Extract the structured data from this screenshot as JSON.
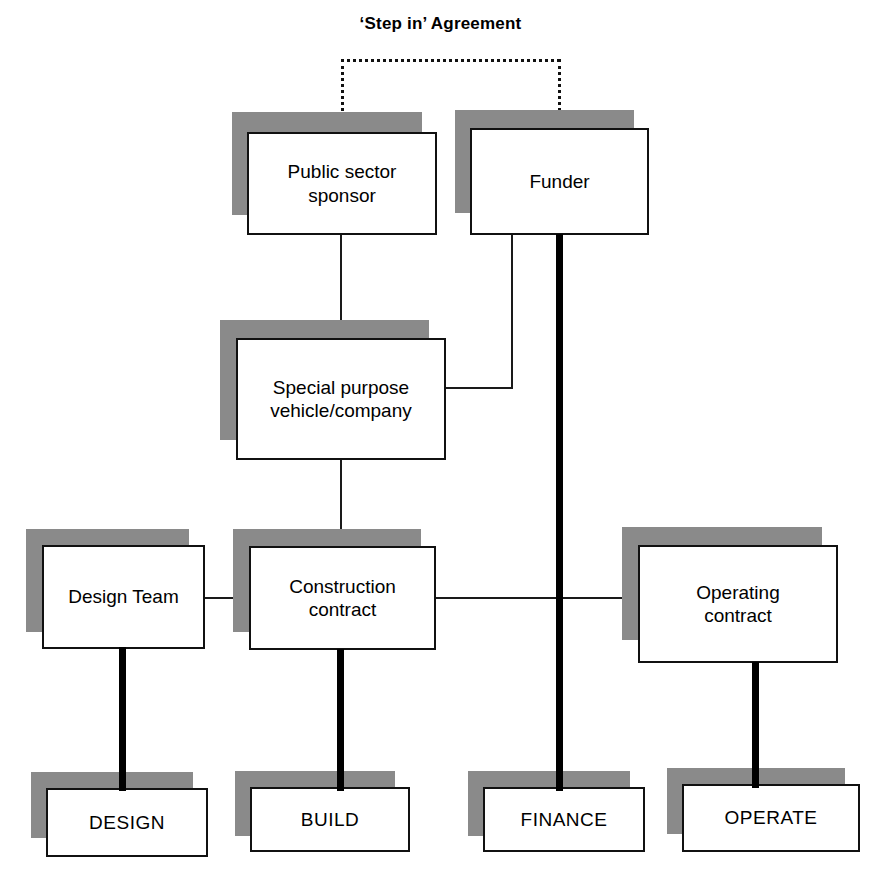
{
  "diagram": {
    "title": "‘Step in’ Agreement",
    "colors": {
      "shadow": "#8a8a8a",
      "border": "#111111",
      "background": "#ffffff",
      "connector": "#1a1a1a",
      "thick_connector": "#000000"
    },
    "nodes": [
      {
        "id": "public-sector-sponsor",
        "label": "Public sector\nsponsor"
      },
      {
        "id": "funder",
        "label": "Funder"
      },
      {
        "id": "special-purpose-vehicle",
        "label": "Special purpose\nvehicle/company"
      },
      {
        "id": "design-team",
        "label": "Design Team"
      },
      {
        "id": "construction-contract",
        "label": "Construction\ncontract"
      },
      {
        "id": "operating-contract",
        "label": "Operating\ncontract"
      },
      {
        "id": "design",
        "label": "DESIGN"
      },
      {
        "id": "build",
        "label": "BUILD"
      },
      {
        "id": "finance",
        "label": "FINANCE"
      },
      {
        "id": "operate",
        "label": "OPERATE"
      }
    ],
    "connections": [
      {
        "id": "step-in-agreement-link",
        "from": "public-sector-sponsor",
        "to": "funder",
        "style": "dotted"
      },
      {
        "id": "sponsor-to-spv",
        "from": "public-sector-sponsor",
        "to": "special-purpose-vehicle",
        "style": "thin"
      },
      {
        "id": "funder-to-spv",
        "from": "funder",
        "to": "special-purpose-vehicle",
        "style": "thin"
      },
      {
        "id": "spv-to-construction",
        "from": "special-purpose-vehicle",
        "to": "construction-contract",
        "style": "thin"
      },
      {
        "id": "design-team-to-construction",
        "from": "design-team",
        "to": "construction-contract",
        "style": "thin"
      },
      {
        "id": "construction-to-operating",
        "from": "construction-contract",
        "to": "operating-contract",
        "style": "thin"
      },
      {
        "id": "design-team-to-design",
        "from": "design-team",
        "to": "design",
        "style": "thick"
      },
      {
        "id": "construction-to-build",
        "from": "construction-contract",
        "to": "build",
        "style": "thick"
      },
      {
        "id": "funder-to-finance",
        "from": "funder",
        "to": "finance",
        "style": "thick"
      },
      {
        "id": "operating-to-operate",
        "from": "operating-contract",
        "to": "operate",
        "style": "thick"
      }
    ]
  }
}
